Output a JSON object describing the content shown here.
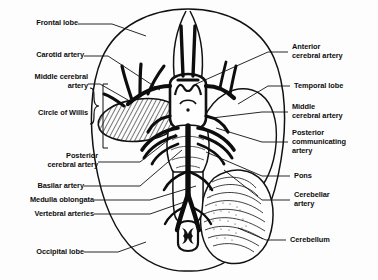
{
  "figure": {
    "type": "anatomical-diagram",
    "colors": {
      "background": "#fdfdfd",
      "ink": "#0d0d0d",
      "artery_fill": "#101010",
      "outline": "#111111"
    }
  },
  "labels": {
    "left": [
      {
        "id": "frontal-lobe",
        "text": "Frontal lobe",
        "lines": [
          "Frontal lobe"
        ]
      },
      {
        "id": "carotid-artery",
        "text": "Carotid artery",
        "lines": [
          "Carotid artery"
        ]
      },
      {
        "id": "middle-cerebral-artery",
        "text": "Middle cerebral artery",
        "lines": [
          "Middle cerebral",
          "artery"
        ]
      },
      {
        "id": "circle-of-willis",
        "text": "Circle of Willis",
        "lines": [
          "Circle of Willis"
        ]
      },
      {
        "id": "posterior-cerebral-artery",
        "text": "Posterior cerebral artery",
        "lines": [
          "Posterior",
          "cerebral artery"
        ]
      },
      {
        "id": "basilar-artery",
        "text": "Basilar artery",
        "lines": [
          "Basilar artery"
        ]
      },
      {
        "id": "medulla-oblongata",
        "text": "Medulla oblongata",
        "lines": [
          "Medulla oblongata"
        ]
      },
      {
        "id": "vertebral-arteries",
        "text": "Vertebral arteries",
        "lines": [
          "Vertebral arteries"
        ]
      },
      {
        "id": "occipital-lobe",
        "text": "Occipital lobe",
        "lines": [
          "Occipital lobe"
        ]
      }
    ],
    "right": [
      {
        "id": "anterior-cerebral-artery",
        "text": "Anterior cerebral artery",
        "lines": [
          "Anterior",
          "cerebral artery"
        ]
      },
      {
        "id": "temporal-lobe",
        "text": "Temporal lobe",
        "lines": [
          "Temporal lobe"
        ]
      },
      {
        "id": "middle-cerebral-artery-right",
        "text": "Middle cerebral artery",
        "lines": [
          "Middle",
          "cerebral artery"
        ]
      },
      {
        "id": "posterior-communicating-artery",
        "text": "Posterior communicating artery",
        "lines": [
          "Posterior",
          "communicating",
          "artery"
        ]
      },
      {
        "id": "pons",
        "text": "Pons",
        "lines": [
          "Pons"
        ]
      },
      {
        "id": "cerebellar-artery",
        "text": "Cerebellar artery",
        "lines": [
          "Cerebellar",
          "artery"
        ]
      },
      {
        "id": "cerebellum",
        "text": "Cerebellum",
        "lines": [
          "Cerebellum"
        ]
      }
    ]
  }
}
